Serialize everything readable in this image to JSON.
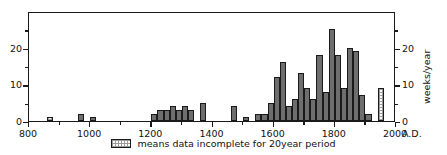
{
  "chart_data": {
    "type": "bar",
    "title": "",
    "xlabel": "",
    "ylabel": "",
    "xlim": [
      800,
      2000
    ],
    "ylim": [
      0,
      30
    ],
    "grid": false,
    "legend_position": "below-center",
    "bin_width": 20,
    "x_axis": {
      "suffix": "A.D.",
      "ticks": [
        800,
        1000,
        1200,
        1400,
        1600,
        1800,
        2000
      ],
      "tick_labels": [
        "800",
        "1000",
        "1200",
        "1400",
        "1600",
        "1800",
        "2000"
      ],
      "minor_ticks": [
        900,
        1100,
        1300,
        1500,
        1700,
        1900
      ]
    },
    "y_axis_left": {
      "ticks": [
        0,
        10,
        20
      ],
      "tick_labels": [
        "0",
        "10",
        "20"
      ],
      "minor_ticks": [
        5,
        15,
        25
      ]
    },
    "y_axis_right": {
      "title": "weeks/year",
      "ticks": [
        0,
        10,
        20
      ],
      "tick_labels": [
        "0",
        "10",
        "20"
      ],
      "minor_ticks": [
        5,
        15,
        25
      ]
    },
    "legend": [
      {
        "swatch": "hatched-white",
        "label": "means data incomplete for 20year period"
      }
    ],
    "series": [
      {
        "name": "weeks per year",
        "fill_color": "#6e6e6e",
        "incomplete_color": "#ffffff",
        "bins": [
          {
            "x": 860,
            "value": 1,
            "incomplete": true
          },
          {
            "x": 960,
            "value": 2,
            "incomplete": false
          },
          {
            "x": 1000,
            "value": 1,
            "incomplete": false
          },
          {
            "x": 1200,
            "value": 2,
            "incomplete": false
          },
          {
            "x": 1220,
            "value": 3,
            "incomplete": false
          },
          {
            "x": 1240,
            "value": 3,
            "incomplete": false
          },
          {
            "x": 1260,
            "value": 4,
            "incomplete": false
          },
          {
            "x": 1280,
            "value": 3,
            "incomplete": false
          },
          {
            "x": 1300,
            "value": 4,
            "incomplete": false
          },
          {
            "x": 1320,
            "value": 3,
            "incomplete": false
          },
          {
            "x": 1360,
            "value": 5,
            "incomplete": false
          },
          {
            "x": 1460,
            "value": 4,
            "incomplete": false
          },
          {
            "x": 1500,
            "value": 1,
            "incomplete": false
          },
          {
            "x": 1540,
            "value": 2,
            "incomplete": false
          },
          {
            "x": 1560,
            "value": 2,
            "incomplete": false
          },
          {
            "x": 1580,
            "value": 5,
            "incomplete": false
          },
          {
            "x": 1600,
            "value": 12,
            "incomplete": false
          },
          {
            "x": 1620,
            "value": 16,
            "incomplete": false
          },
          {
            "x": 1640,
            "value": 4,
            "incomplete": false
          },
          {
            "x": 1660,
            "value": 6,
            "incomplete": false
          },
          {
            "x": 1680,
            "value": 13,
            "incomplete": false
          },
          {
            "x": 1700,
            "value": 9,
            "incomplete": false
          },
          {
            "x": 1720,
            "value": 6,
            "incomplete": false
          },
          {
            "x": 1740,
            "value": 18,
            "incomplete": false
          },
          {
            "x": 1760,
            "value": 8,
            "incomplete": false
          },
          {
            "x": 1780,
            "value": 25,
            "incomplete": false
          },
          {
            "x": 1800,
            "value": 18,
            "incomplete": false
          },
          {
            "x": 1820,
            "value": 9,
            "incomplete": false
          },
          {
            "x": 1840,
            "value": 20,
            "incomplete": false
          },
          {
            "x": 1860,
            "value": 19,
            "incomplete": false
          },
          {
            "x": 1880,
            "value": 7,
            "incomplete": false
          },
          {
            "x": 1900,
            "value": 2,
            "incomplete": false
          },
          {
            "x": 1940,
            "value": 9,
            "incomplete": true
          }
        ]
      }
    ]
  }
}
